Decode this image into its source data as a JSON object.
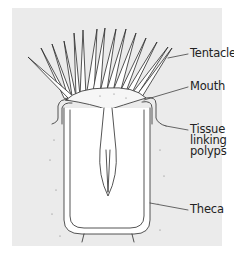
{
  "diagram": {
    "colors": {
      "panel": "#ebebeb",
      "line": "#2a2a2a",
      "fill": "#ffffff"
    },
    "labels": [
      {
        "id": "tentacle",
        "text": "Tentacle"
      },
      {
        "id": "mouth",
        "text": "Mouth"
      },
      {
        "id": "tissue",
        "lines": [
          "Tissue",
          "linking",
          "polyps"
        ]
      },
      {
        "id": "theca",
        "text": "Theca"
      }
    ]
  }
}
